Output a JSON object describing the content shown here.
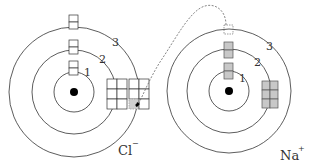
{
  "diagram": {
    "type": "ionic-bond-electron-transfer",
    "colors": {
      "line": "#333333",
      "filled_box": "#c8c8c8",
      "empty_box": "#ffffff",
      "nucleus": "#000000",
      "transfer_path": "#555555"
    },
    "atoms": [
      {
        "id": "chlorine",
        "symbol": "Cl",
        "charge": "−",
        "ion_label": "Cl",
        "shells": [
          {
            "number": "1",
            "label": "1"
          },
          {
            "number": "2",
            "label": "2"
          },
          {
            "number": "3",
            "label": "3"
          }
        ],
        "orbital_boxes": {
          "shell_1_s": "empty",
          "shell_2_s": "empty",
          "shell_2_p": "empty 2x3 grid",
          "shell_3_s": "empty",
          "shell_3_p": "2x3 grid, one cell shaded (received electron)"
        }
      },
      {
        "id": "sodium",
        "symbol": "Na",
        "charge": "+",
        "ion_label": "Na",
        "shells": [
          {
            "number": "1",
            "label": "1"
          },
          {
            "number": "2",
            "label": "2"
          },
          {
            "number": "3",
            "label": "3"
          }
        ],
        "orbital_boxes": {
          "shell_1_s": "filled",
          "shell_2_s": "filled",
          "shell_2_p": "filled 2x3 grid",
          "shell_3_s": "dotted (electron removed)"
        }
      }
    ],
    "transfer": {
      "from": "Na shell 3",
      "to": "Cl shell 3 p-orbital",
      "style": "dashed arrow"
    }
  }
}
